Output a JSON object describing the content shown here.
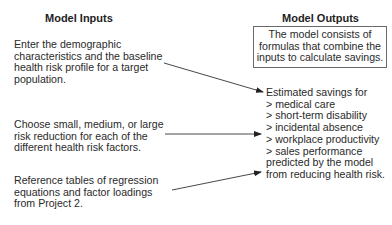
{
  "inputs": {
    "heading": "Model Inputs",
    "items": [
      {
        "lines": [
          "Enter the demographic",
          "characteristics and the baseline",
          "health risk profile for a target",
          "population."
        ]
      },
      {
        "lines": [
          "Choose small, medium, or large",
          "risk reduction for each of the",
          "different health risk factors."
        ]
      },
      {
        "lines": [
          "Reference tables of regression",
          "equations and factor loadings",
          "from Project 2."
        ]
      }
    ]
  },
  "outputs": {
    "heading": "Model Outputs",
    "model_box": {
      "lines": [
        "The model consists of",
        "formulas that combine the",
        "inputs to calculate savings."
      ]
    },
    "result": {
      "lines": [
        "Estimated savings for",
        "> medical care",
        "> short-term disability",
        "> incidental absence",
        "> workplace productivity",
        "> sales performance",
        "predicted by the model",
        "from reducing health risk."
      ]
    }
  },
  "colors": {
    "text": "#2a2a2a",
    "arrow": "#333333",
    "box_border": "#6a6a6a"
  }
}
